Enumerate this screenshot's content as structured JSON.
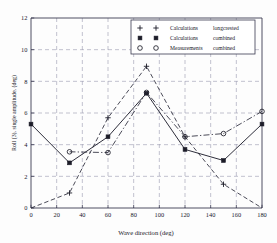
{
  "chart_data": {
    "type": "line",
    "title": "",
    "xlabel": "Wave direction (deg)",
    "ylabel": "Roll (3), single amplitude, (deg)",
    "xlim": [
      0,
      180
    ],
    "ylim": [
      0,
      12
    ],
    "xticks": [
      0,
      20,
      40,
      60,
      80,
      100,
      120,
      140,
      160,
      180
    ],
    "yticks": [
      0,
      2,
      4,
      6,
      8,
      10,
      12
    ],
    "xtick_labels": [
      "0",
      "20",
      "40",
      "60",
      "80",
      "100",
      "120",
      "140",
      "160",
      "180"
    ],
    "ytick_labels": [
      "0",
      "2",
      "4",
      "6",
      "8",
      "10",
      "12"
    ],
    "grid": true,
    "grid_style": "dashed",
    "legend_position": "upper right",
    "series": [
      {
        "name": "Calculations",
        "qualifier": "longcrested",
        "marker": "plus",
        "linestyle": "dashed",
        "x": [
          0,
          30,
          60,
          90,
          120,
          150,
          180
        ],
        "values": [
          0.0,
          0.95,
          5.7,
          8.95,
          4.5,
          1.5,
          0.0
        ]
      },
      {
        "name": "Calculations",
        "qualifier": "combined",
        "marker": "filled-square",
        "linestyle": "solid",
        "x": [
          0,
          30,
          60,
          90,
          120,
          150,
          180
        ],
        "values": [
          5.3,
          2.85,
          4.5,
          7.25,
          3.7,
          3.0,
          5.3
        ]
      },
      {
        "name": "Measurements",
        "qualifier": "combined",
        "marker": "open-circle",
        "linestyle": "dash-dot",
        "x": [
          30,
          60,
          90,
          120,
          150,
          180
        ],
        "values": [
          3.55,
          3.5,
          7.3,
          4.5,
          4.7,
          6.1
        ]
      }
    ]
  },
  "legend": {
    "rows": [
      {
        "name": "Calculations",
        "qualifier": "longcrested"
      },
      {
        "name": "Calculations",
        "qualifier": "combined"
      },
      {
        "name": "Measurements",
        "qualifier": "combined"
      }
    ]
  }
}
